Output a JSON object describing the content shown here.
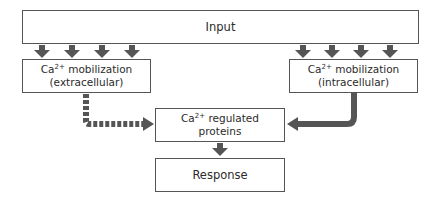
{
  "diagram": {
    "input": {
      "label": "Input"
    },
    "extracellular": {
      "prefix": "Ca",
      "sup": "2+",
      "line1": " mobilization",
      "line2": "(extracellular)"
    },
    "intracellular": {
      "prefix": "Ca",
      "sup": "2+",
      "line1": " mobilization",
      "line2": "(intracellular)"
    },
    "regulated": {
      "prefix": "Ca",
      "sup": "2+",
      "line1": " regulated",
      "line2": "proteins"
    },
    "response": {
      "label": "Response"
    },
    "arrows": [
      {
        "from": "input",
        "to": "extracellular",
        "count": 4,
        "style": "solid"
      },
      {
        "from": "input",
        "to": "intracellular",
        "count": 4,
        "style": "solid"
      },
      {
        "from": "extracellular",
        "to": "regulated",
        "style": "dashed"
      },
      {
        "from": "intracellular",
        "to": "regulated",
        "style": "solid"
      },
      {
        "from": "regulated",
        "to": "response",
        "style": "solid"
      }
    ],
    "colors": {
      "arrow": "#555555",
      "border": "#555555",
      "text": "#2b2b2b"
    }
  }
}
